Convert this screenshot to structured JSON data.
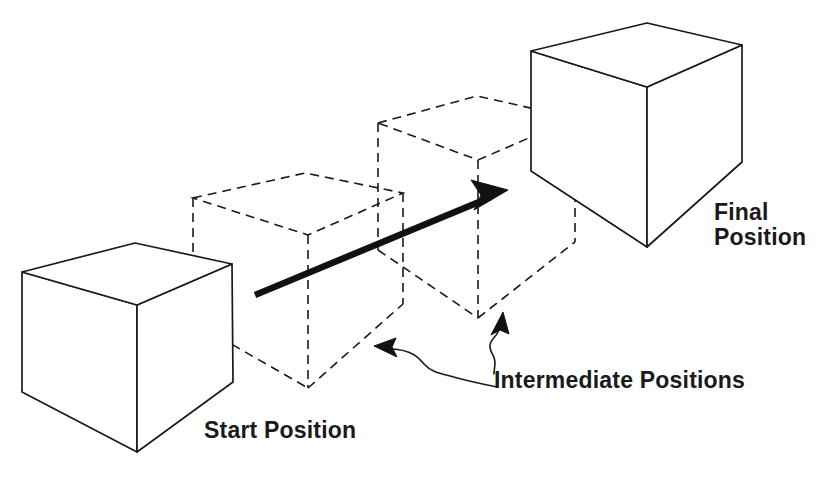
{
  "figure": {
    "type": "technical-illustration",
    "background_color": "#ffffff",
    "line_color": "#1a1a1a",
    "labels": {
      "start": "Start Position",
      "intermediate": "Intermediate Positions",
      "final_line1": "Final",
      "final_line2": "Position"
    }
  },
  "objects": {
    "start_cube": {
      "name": "start-cube",
      "style": "solid",
      "top_face": "22,272 135,243 232,264 137,305",
      "left_face": "22,272 137,305 137,452 22,392",
      "right_face": "137,305 232,264 233,382 137,452"
    },
    "intermediate_cube_1": {
      "name": "intermediate-cube-1",
      "style": "dashed",
      "top_face": "193,198 305,173 403,193 308,235",
      "left_face": "193,198 308,235 308,388 193,322",
      "right_face": "308,235 403,193 403,304 308,388"
    },
    "intermediate_cube_2": {
      "name": "intermediate-cube-2",
      "style": "dashed",
      "top_face": "378,123 477,96 575,118 478,160",
      "left_face": "378,123 478,160 478,318 378,250",
      "right_face": "478,160 575,118 575,242 478,318"
    },
    "final_cube": {
      "name": "final-cube",
      "style": "solid",
      "top_face": "531,51 647,23 742,45 647,87",
      "left_face": "531,51 647,87 647,247 531,171",
      "right_face": "647,87 742,45 742,162 647,247"
    },
    "motion_arrow": {
      "name": "motion-arrow",
      "from": "255,295",
      "to": "508,190",
      "stroke_width": 6
    },
    "leader_left": {
      "name": "leader-line-left",
      "tip": "375,347",
      "tail": "495,386"
    },
    "leader_right": {
      "name": "leader-line-right",
      "tip": "502,313",
      "tail": "494,372"
    }
  }
}
